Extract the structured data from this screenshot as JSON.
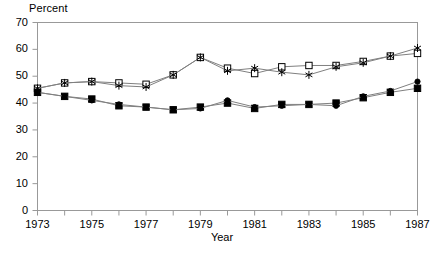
{
  "chart_data": {
    "type": "line",
    "title": "",
    "ylabel": "Percent",
    "xlabel": "Year",
    "ylim": [
      0,
      70
    ],
    "ytick_values": [
      0,
      10,
      20,
      30,
      40,
      50,
      60,
      70
    ],
    "ytick_labels": [
      "0",
      "10",
      "20",
      "30",
      "40",
      "50",
      "60",
      "70"
    ],
    "xlim": [
      1973,
      1987
    ],
    "x": [
      1973,
      1974,
      1975,
      1976,
      1977,
      1978,
      1979,
      1980,
      1981,
      1982,
      1983,
      1984,
      1985,
      1986,
      1987
    ],
    "xtick_values": [
      1973,
      1974,
      1975,
      1976,
      1977,
      1978,
      1979,
      1980,
      1981,
      1982,
      1983,
      1984,
      1985,
      1986,
      1987
    ],
    "xtick_labels": [
      "1973",
      "",
      "1975",
      "",
      "1977",
      "",
      "1979",
      "",
      "1981",
      "",
      "1983",
      "",
      "1985",
      "",
      "1987"
    ],
    "grid": false,
    "legend": "none",
    "series": [
      {
        "name": "open-square-series",
        "marker": "open-square",
        "line_color": "#808080",
        "marker_color": "#000000",
        "values": [
          45.5,
          47.5,
          48.0,
          47.5,
          47.0,
          50.5,
          57.0,
          53.0,
          51.0,
          53.5,
          54.0,
          54.0,
          55.5,
          57.5,
          58.5
        ]
      },
      {
        "name": "star-series",
        "marker": "star",
        "line_color": "#808080",
        "marker_color": "#000000",
        "values": [
          45.5,
          47.5,
          48.0,
          46.5,
          46.0,
          50.5,
          57.0,
          52.0,
          53.0,
          51.5,
          50.5,
          53.5,
          55.0,
          57.5,
          60.5
        ]
      },
      {
        "name": "filled-square-series",
        "marker": "filled-square",
        "line_color": "#808080",
        "marker_color": "#000000",
        "values": [
          44.0,
          42.5,
          41.5,
          39.0,
          38.5,
          37.5,
          38.5,
          40.0,
          38.0,
          39.5,
          39.5,
          40.0,
          42.0,
          44.0,
          45.5
        ]
      },
      {
        "name": "filled-circle-series",
        "marker": "filled-circle",
        "line_color": "#808080",
        "marker_color": "#000000",
        "values": [
          44.0,
          42.5,
          41.0,
          39.5,
          38.5,
          37.5,
          38.0,
          41.0,
          38.5,
          39.0,
          39.5,
          39.0,
          42.5,
          44.5,
          48.0
        ]
      }
    ]
  },
  "axes": {
    "frame_color": "#999999",
    "background": "#ffffff"
  }
}
